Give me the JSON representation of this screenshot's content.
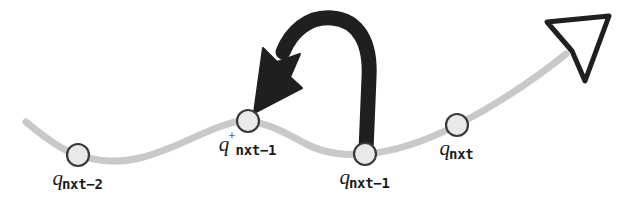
{
  "figure": {
    "background_color": "#ffffff",
    "width": 209,
    "colors": {
      "path": "#c9c9c9",
      "node_fill": "#e9e9e9",
      "node_stroke": "#3a3a3a",
      "arrow": "#1f1f1f",
      "heading_arrow_stroke": "#1f1f1f",
      "label_text": "#1a1a1a"
    }
  },
  "path": {
    "name": "configuration-path-curve",
    "description": "light gray wavy path rising to the right"
  },
  "nodes": [
    {
      "id": "q-nxt-minus-2",
      "symbol": "q",
      "subscript": "nxt−2",
      "superscript": "",
      "cx": 78,
      "cy": 155,
      "r": 11,
      "label_x": 78,
      "label_y": 168
    },
    {
      "id": "q-nxt-minus-1-plus",
      "symbol": "q",
      "subscript": "nxt−1",
      "superscript": "+",
      "cx": 248,
      "cy": 121,
      "r": 11,
      "label_x": 248,
      "label_y": 134
    },
    {
      "id": "q-nxt-minus-1",
      "symbol": "q",
      "subscript": "nxt−1",
      "superscript": "",
      "cx": 365,
      "cy": 154,
      "r": 11,
      "label_x": 365,
      "label_y": 167
    },
    {
      "id": "q-nxt",
      "symbol": "q",
      "subscript": "nxt",
      "superscript": "",
      "cx": 457,
      "cy": 125,
      "r": 11,
      "label_x": 457,
      "label_y": 138
    }
  ],
  "annotations": {
    "retraction_arrow": {
      "name": "retraction-arrow",
      "from_node": "q-nxt-minus-1",
      "to_node": "q-nxt-minus-1-plus",
      "style": "thick black arc with solid arrowhead"
    },
    "heading_marker": {
      "name": "heading-arrowhead",
      "style": "hollow outlined dart at path end"
    }
  }
}
